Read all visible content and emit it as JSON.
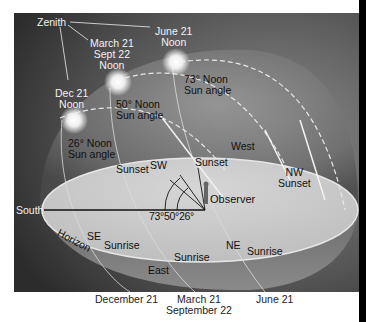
{
  "diagram": {
    "title_labels": {
      "zenith": "Zenith",
      "june_noon": [
        "June 21",
        "Noon"
      ],
      "equinox_noon": [
        "March 21",
        "Sept 22",
        "Noon"
      ],
      "dec_noon": [
        "Dec 21",
        "Noon"
      ]
    },
    "sun_angles": [
      {
        "label": [
          "73° Noon",
          "Sun angle"
        ],
        "season": "June 21"
      },
      {
        "label": [
          "50° Noon",
          "Sun angle"
        ],
        "season": "March 21 / Sept 22"
      },
      {
        "label": [
          "26° Noon",
          "Sun angle"
        ],
        "season": "Dec 21"
      }
    ],
    "directions": {
      "south": "South",
      "west": "West",
      "east": "East",
      "sw": "SW",
      "se": "SE",
      "ne": "NE",
      "nw": "NW",
      "horizon": "Horizon"
    },
    "events": {
      "sunset_sw": "Sunset",
      "sunset_w": "Sunset",
      "sunset_nw": "Sunset",
      "sunrise_se": "Sunrise",
      "sunrise_e": "Sunrise",
      "sunrise_ne": "Sunrise"
    },
    "observer": "Observer",
    "angle_labels": "73°50°26°",
    "bottom_dates": {
      "dec": "December 21",
      "mar": "March 21",
      "sep": "September 22",
      "jun": "June 21"
    },
    "colors": {
      "frame_dark": "#3c3c3c",
      "dome": "#7a7a7a",
      "horizon_disc": "#cfcfcf",
      "sun_glow": "#ffffff"
    }
  }
}
